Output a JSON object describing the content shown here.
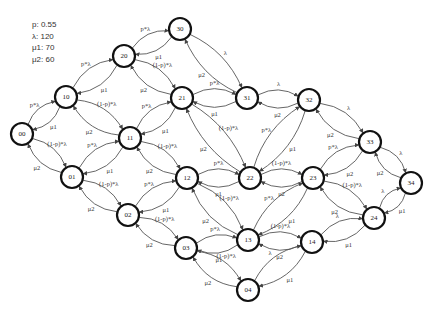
{
  "parameters": [
    {
      "name": "p",
      "value": "0.55",
      "text": "p: 0.55"
    },
    {
      "name": "lambda",
      "value": "120",
      "text": "λ: 120"
    },
    {
      "name": "mu1",
      "value": "70",
      "text": "μ1: 70"
    },
    {
      "name": "mu2",
      "value": "60",
      "text": "μ2: 60"
    }
  ],
  "nodes": [
    {
      "id": "00",
      "x": 22,
      "y": 134
    },
    {
      "id": "10",
      "x": 66,
      "y": 97
    },
    {
      "id": "20",
      "x": 124,
      "y": 56
    },
    {
      "id": "30",
      "x": 180,
      "y": 29
    },
    {
      "id": "01",
      "x": 72,
      "y": 177
    },
    {
      "id": "11",
      "x": 130,
      "y": 138
    },
    {
      "id": "21",
      "x": 182,
      "y": 98
    },
    {
      "id": "31",
      "x": 247,
      "y": 98
    },
    {
      "id": "02",
      "x": 128,
      "y": 215
    },
    {
      "id": "12",
      "x": 187,
      "y": 178
    },
    {
      "id": "22",
      "x": 250,
      "y": 178
    },
    {
      "id": "32",
      "x": 309,
      "y": 100
    },
    {
      "id": "03",
      "x": 186,
      "y": 248
    },
    {
      "id": "13",
      "x": 248,
      "y": 240
    },
    {
      "id": "23",
      "x": 313,
      "y": 178
    },
    {
      "id": "33",
      "x": 370,
      "y": 142
    },
    {
      "id": "04",
      "x": 248,
      "y": 290
    },
    {
      "id": "14",
      "x": 312,
      "y": 242
    },
    {
      "id": "24",
      "x": 374,
      "y": 218
    },
    {
      "id": "34",
      "x": 411,
      "y": 183
    }
  ],
  "edges": [
    {
      "from": "00",
      "to": "10",
      "label": "p*λ"
    },
    {
      "from": "10",
      "to": "00",
      "label": "μ1"
    },
    {
      "from": "00",
      "to": "01",
      "label": "(1-p)*λ"
    },
    {
      "from": "01",
      "to": "00",
      "label": "μ2"
    },
    {
      "from": "10",
      "to": "20",
      "label": "p*λ"
    },
    {
      "from": "20",
      "to": "10",
      "label": "μ1"
    },
    {
      "from": "10",
      "to": "11",
      "label": "(1-p)*λ"
    },
    {
      "from": "11",
      "to": "10",
      "label": "μ2"
    },
    {
      "from": "20",
      "to": "30",
      "label": "p*λ"
    },
    {
      "from": "30",
      "to": "20",
      "label": "μ1"
    },
    {
      "from": "20",
      "to": "21",
      "label": "(1-p)*λ"
    },
    {
      "from": "21",
      "to": "20",
      "label": "μ2"
    },
    {
      "from": "30",
      "to": "31",
      "label": "λ"
    },
    {
      "from": "31",
      "to": "30",
      "label": "μ2"
    },
    {
      "from": "01",
      "to": "11",
      "label": "p*λ"
    },
    {
      "from": "11",
      "to": "01",
      "label": "μ1"
    },
    {
      "from": "01",
      "to": "02",
      "label": "(1-p)*λ"
    },
    {
      "from": "02",
      "to": "01",
      "label": "μ2"
    },
    {
      "from": "11",
      "to": "21",
      "label": "p*λ"
    },
    {
      "from": "21",
      "to": "11",
      "label": "μ1"
    },
    {
      "from": "11",
      "to": "12",
      "label": "(1-p)*λ"
    },
    {
      "from": "12",
      "to": "11",
      "label": "μ2"
    },
    {
      "from": "21",
      "to": "31",
      "label": "p*λ"
    },
    {
      "from": "31",
      "to": "21",
      "label": "μ1"
    },
    {
      "from": "21",
      "to": "22",
      "label": "(1-p)*λ"
    },
    {
      "from": "22",
      "to": "21",
      "label": "μ2"
    },
    {
      "from": "31",
      "to": "32",
      "label": "λ"
    },
    {
      "from": "32",
      "to": "31",
      "label": "μ2"
    },
    {
      "from": "02",
      "to": "12",
      "label": "p*λ"
    },
    {
      "from": "12",
      "to": "02",
      "label": "μ1"
    },
    {
      "from": "02",
      "to": "03",
      "label": "(1-p)*λ"
    },
    {
      "from": "03",
      "to": "02",
      "label": "μ2"
    },
    {
      "from": "12",
      "to": "22",
      "label": "p*λ"
    },
    {
      "from": "22",
      "to": "12",
      "label": "μ1"
    },
    {
      "from": "12",
      "to": "13",
      "label": "(1-p)*λ"
    },
    {
      "from": "13",
      "to": "12",
      "label": "μ2"
    },
    {
      "from": "22",
      "to": "32",
      "label": "p*λ"
    },
    {
      "from": "32",
      "to": "22",
      "label": "μ1"
    },
    {
      "from": "22",
      "to": "23",
      "label": "(1-p)*λ"
    },
    {
      "from": "23",
      "to": "22",
      "label": "μ2"
    },
    {
      "from": "32",
      "to": "33",
      "label": "λ"
    },
    {
      "from": "33",
      "to": "32",
      "label": "μ2"
    },
    {
      "from": "03",
      "to": "13",
      "label": "p*λ"
    },
    {
      "from": "13",
      "to": "03",
      "label": "μ1"
    },
    {
      "from": "03",
      "to": "04",
      "label": "(1-p)*λ"
    },
    {
      "from": "04",
      "to": "03",
      "label": "μ2"
    },
    {
      "from": "13",
      "to": "23",
      "label": "p*λ"
    },
    {
      "from": "23",
      "to": "13",
      "label": "μ1"
    },
    {
      "from": "13",
      "to": "14",
      "label": "(1-p)*λ"
    },
    {
      "from": "14",
      "to": "13",
      "label": "μ2"
    },
    {
      "from": "23",
      "to": "33",
      "label": "p*λ"
    },
    {
      "from": "33",
      "to": "23",
      "label": "μ2"
    },
    {
      "from": "23",
      "to": "24",
      "label": "(1-p)*λ"
    },
    {
      "from": "24",
      "to": "23",
      "label": "μ2"
    },
    {
      "from": "33",
      "to": "34",
      "label": "λ"
    },
    {
      "from": "34",
      "to": "33",
      "label": "μ2"
    },
    {
      "from": "04",
      "to": "14",
      "label": "λ"
    },
    {
      "from": "14",
      "to": "04",
      "label": "μ1"
    },
    {
      "from": "14",
      "to": "24",
      "label": "λ"
    },
    {
      "from": "24",
      "to": "14",
      "label": "μ1"
    },
    {
      "from": "24",
      "to": "34",
      "label": "λ"
    },
    {
      "from": "34",
      "to": "24",
      "label": "μ1"
    }
  ]
}
